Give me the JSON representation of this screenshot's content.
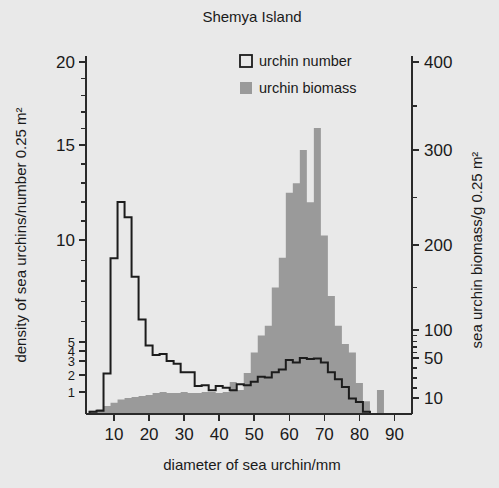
{
  "figure": {
    "title": "Shemya Island",
    "background_color": "#e9e9e9",
    "biomass_color": "#9a9a9a",
    "number_color": "#1c1c1c"
  },
  "legend": {
    "position": "top-center",
    "items": [
      {
        "label": "urchin number",
        "swatch": "open-square",
        "color": "#e9e9e9"
      },
      {
        "label": "urchin biomass",
        "swatch": "filled-square",
        "color": "#9a9a9a"
      }
    ]
  },
  "axes": {
    "x": {
      "label": "diameter of sea urchin/mm",
      "ticks": [
        10,
        20,
        30,
        40,
        50,
        60,
        70,
        80,
        90
      ],
      "tick_labels": [
        "10",
        "20",
        "30",
        "40",
        "50",
        "60",
        "70",
        "80",
        "90"
      ],
      "range": [
        2,
        95
      ]
    },
    "y_left": {
      "label": "density of sea urchins/number 0.25 m²",
      "ticks": [
        1,
        2,
        3,
        4,
        5,
        10,
        15,
        20
      ],
      "tick_labels": [
        "1",
        "2",
        "3",
        "4",
        "5",
        "10",
        "15",
        "20"
      ],
      "minor_ticks": [
        6,
        7,
        8,
        9,
        11,
        12,
        13,
        14,
        16,
        17,
        18,
        19
      ],
      "range": [
        0,
        21
      ],
      "scale": "linear-stacked"
    },
    "y_right": {
      "label": "sea urchin biomass/g 0.25 m²",
      "ticks": [
        10,
        50,
        100,
        200,
        300,
        400
      ],
      "tick_labels": [
        "10",
        "50",
        "100",
        "200",
        "300",
        "400"
      ],
      "minor_ticks": [
        20,
        30,
        40,
        60,
        70,
        80,
        90,
        150,
        250,
        350
      ],
      "range": [
        0,
        420
      ]
    }
  },
  "chart_data": {
    "type": "bar",
    "title": "Shemya Island",
    "xlabel": "diameter of sea urchin/mm",
    "ylabel": "density of sea urchins/number 0.25 m²",
    "ylabel_right": "sea urchin biomass/g 0.25 m²",
    "xlim": [
      2,
      95
    ],
    "ylim": [
      0,
      21
    ],
    "ylim_right": [
      0,
      420
    ],
    "grid": false,
    "legend_position": "top-center",
    "bin_width": 2,
    "categories": [
      4,
      6,
      8,
      10,
      12,
      14,
      16,
      18,
      20,
      22,
      24,
      26,
      28,
      30,
      32,
      34,
      36,
      38,
      40,
      42,
      44,
      46,
      48,
      50,
      52,
      54,
      56,
      58,
      60,
      62,
      64,
      66,
      68,
      70,
      72,
      74,
      76,
      78,
      80,
      82,
      84,
      86,
      88,
      90
    ],
    "series": [
      {
        "name": "urchin number",
        "axis": "left",
        "units": "number 0.25 m²",
        "values": [
          0.1,
          0.15,
          2.1,
          9.1,
          12.0,
          11.2,
          8.2,
          6.1,
          4.6,
          3.6,
          3.7,
          3.0,
          2.8,
          2.2,
          2.2,
          1.35,
          1.4,
          1.1,
          1.35,
          1.25,
          1.1,
          1.45,
          1.4,
          1.6,
          1.9,
          1.85,
          2.2,
          2.4,
          3.1,
          2.9,
          3.3,
          3.2,
          3.25,
          2.9,
          2.2,
          1.75,
          1.3,
          0.7,
          0.55,
          0.1,
          0.0,
          0.0,
          0.0,
          0.0
        ]
      },
      {
        "name": "urchin biomass",
        "axis": "right",
        "units": "g 0.25 m²",
        "values": [
          2,
          3,
          5,
          7,
          9,
          10,
          11,
          12,
          13,
          15,
          16,
          15,
          15,
          16,
          15,
          15,
          16,
          16,
          15,
          16,
          26,
          18,
          35,
          60,
          90,
          105,
          150,
          185,
          255,
          265,
          300,
          245,
          325,
          210,
          140,
          105,
          75,
          60,
          25,
          8,
          0,
          18,
          0,
          0
        ]
      }
    ],
    "annotations": [
      "urchin number peaks at 12 per 0.25 m² near 12 mm diameter",
      "urchin biomass peaks near 325 g per 0.25 m² around 68 mm diameter",
      "isolated biomass bar near 86 mm"
    ]
  }
}
